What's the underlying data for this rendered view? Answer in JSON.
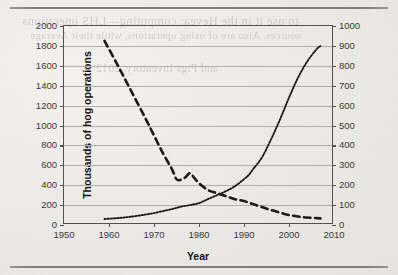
{
  "page": {
    "background_color": "#eceae7",
    "rule_color": "#6f6c68",
    "ghost_text_1": "to use it in the Hevea: computing—LHS operations",
    "ghost_text_2": "sources. Also are of using operations, while their Average",
    "ghost_text_3": "and Pigs Inventory, 2012"
  },
  "chart_data": {
    "type": "line",
    "title": "",
    "xlabel": "Year",
    "ylabel": "Thousands of hog operations",
    "y2label": "Average number of hogs per operation",
    "xlim": [
      1950,
      2010
    ],
    "ylim": [
      0,
      2000
    ],
    "y2lim": [
      0,
      1000
    ],
    "xticks": [
      1950,
      1960,
      1970,
      1980,
      1990,
      2000,
      2010
    ],
    "yticks": [
      0,
      200,
      400,
      600,
      800,
      1000,
      1200,
      1400,
      1600,
      1800,
      2000
    ],
    "y2ticks": [
      0,
      100,
      200,
      300,
      400,
      500,
      600,
      700,
      800,
      900,
      1000
    ],
    "grid": true,
    "grid_color": "#b2aeaa",
    "legend": "none",
    "line_color": "#1d1b19",
    "series": [
      {
        "name": "Thousands of hog operations",
        "axis": "left",
        "style": "dashed",
        "x": [
          1959,
          1962,
          1965,
          1968,
          1970,
          1972,
          1974,
          1975,
          1976,
          1977,
          1978,
          1979,
          1980,
          1982,
          1984,
          1986,
          1988,
          1990,
          1992,
          1994,
          1996,
          1998,
          2000,
          2002,
          2004,
          2007
        ],
        "values": [
          1850,
          1600,
          1340,
          1080,
          900,
          720,
          560,
          460,
          455,
          480,
          520,
          470,
          420,
          350,
          320,
          290,
          260,
          240,
          210,
          180,
          150,
          125,
          100,
          85,
          75,
          67
        ]
      },
      {
        "name": "Average number of hogs per operation",
        "axis": "right",
        "style": "dotted",
        "x": [
          1959,
          1962,
          1965,
          1968,
          1970,
          1972,
          1974,
          1976,
          1978,
          1980,
          1982,
          1984,
          1986,
          1988,
          1990,
          1991,
          1992,
          1994,
          1996,
          1998,
          2000,
          2002,
          2004,
          2006,
          2007
        ],
        "values": [
          30,
          35,
          42,
          52,
          60,
          70,
          80,
          92,
          100,
          110,
          130,
          150,
          170,
          195,
          230,
          250,
          280,
          340,
          430,
          530,
          640,
          740,
          820,
          880,
          900
        ]
      }
    ]
  }
}
